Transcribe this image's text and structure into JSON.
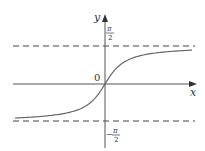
{
  "chart_data": {
    "type": "line",
    "title": "",
    "function": "y = arctan(x)",
    "xlabel": "x",
    "ylabel": "y",
    "origin_label": "0",
    "asymptotes": [
      {
        "y": 1.5708,
        "label_num": "π",
        "label_den": "2",
        "label_sign": "",
        "style": "dashed"
      },
      {
        "y": -1.5708,
        "label_num": "π",
        "label_den": "2",
        "label_sign": "−",
        "style": "dashed"
      }
    ],
    "series": [
      {
        "name": "arctan(x)",
        "x": [
          -6,
          -5,
          -4,
          -3,
          -2,
          -1,
          -0.5,
          0,
          0.5,
          1,
          2,
          3,
          4,
          5,
          6
        ],
        "values": [
          -1.4056,
          -1.3734,
          -1.3258,
          -1.249,
          -1.1071,
          -0.7854,
          -0.4636,
          0,
          0.4636,
          0.7854,
          1.1071,
          1.249,
          1.3258,
          1.3734,
          1.4056
        ]
      }
    ],
    "xlim": [
      -6,
      6
    ],
    "ylim": [
      -2.1,
      2.4
    ],
    "grid": false,
    "legend": null
  },
  "colors": {
    "axis": "#555555",
    "curve": "#666666",
    "asymptote": "#444444"
  }
}
